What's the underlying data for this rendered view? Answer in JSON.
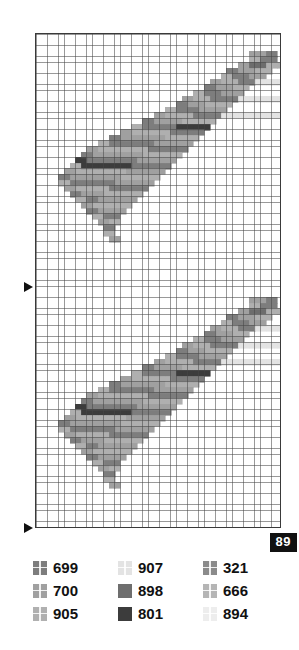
{
  "figure": {
    "page_badge": "89",
    "map": {
      "grid": {
        "cell_px": 5.6,
        "cols": 44,
        "rows": 88,
        "line_color": "#464646",
        "background": "#ffffff",
        "border_color": "#3a3a3a"
      },
      "markers": [
        {
          "name": "tick-arrow-mid",
          "glyph": "right-triangle",
          "y": 287
        },
        {
          "name": "tick-arrow-bottom",
          "glyph": "right-triangle",
          "y": 528
        }
      ]
    },
    "legend": {
      "columns": 3,
      "rows": [
        [
          {
            "code": "699",
            "color": "#7d7d7d",
            "pattern": "cross"
          },
          {
            "code": "907",
            "color": "#e3e3e3",
            "pattern": "cross"
          },
          {
            "code": "321",
            "color": "#8b8b8b",
            "pattern": "cross"
          }
        ],
        [
          {
            "code": "700",
            "color": "#a0a0a0",
            "pattern": "cross"
          },
          {
            "code": "898",
            "color": "#6e6e6e",
            "pattern": "solid"
          },
          {
            "code": "666",
            "color": "#b5b5b5",
            "pattern": "cross"
          }
        ],
        [
          {
            "code": "905",
            "color": "#b0b0b0",
            "pattern": "cross"
          },
          {
            "code": "801",
            "color": "#3c3c3c",
            "pattern": "solid"
          },
          {
            "code": "894",
            "color": "#ededed",
            "pattern": "cross"
          }
        ]
      ]
    },
    "chart_data": {
      "type": "heatmap",
      "title": "",
      "xlabel": "",
      "ylabel": "",
      "grid": true,
      "legend_position": "bottom",
      "categories": [
        "699",
        "700",
        "905",
        "907",
        "898",
        "801",
        "321",
        "666",
        "894"
      ],
      "class_colors": [
        "#7d7d7d",
        "#a0a0a0",
        "#b0b0b0",
        "#e3e3e3",
        "#6e6e6e",
        "#3c3c3c",
        "#8b8b8b",
        "#b5b5b5",
        "#ededed"
      ],
      "description": "Rasterised dendritic/branching soil-or-drainage map on a 44x88 square grid; the same branching motif repeats twice vertically.",
      "cells": {
        "note": "Run-length description per row band of the repeating 44x44 motif: [row, startCol, endCol, classIndex]",
        "runs": [
          [
            3,
            38,
            40,
            1
          ],
          [
            3,
            41,
            42,
            0
          ],
          [
            4,
            38,
            39,
            2
          ],
          [
            4,
            40,
            42,
            0
          ],
          [
            5,
            36,
            37,
            1
          ],
          [
            5,
            38,
            40,
            4
          ],
          [
            5,
            41,
            43,
            2
          ],
          [
            6,
            34,
            35,
            0
          ],
          [
            6,
            36,
            38,
            1
          ],
          [
            6,
            39,
            41,
            2
          ],
          [
            7,
            33,
            34,
            2
          ],
          [
            7,
            35,
            37,
            0
          ],
          [
            7,
            38,
            40,
            1
          ],
          [
            8,
            31,
            32,
            1
          ],
          [
            8,
            33,
            35,
            2
          ],
          [
            8,
            36,
            38,
            0
          ],
          [
            8,
            39,
            43,
            3
          ],
          [
            9,
            30,
            31,
            0
          ],
          [
            9,
            32,
            34,
            1
          ],
          [
            9,
            35,
            37,
            2
          ],
          [
            10,
            28,
            29,
            2
          ],
          [
            10,
            30,
            32,
            0
          ],
          [
            10,
            33,
            36,
            1
          ],
          [
            11,
            26,
            27,
            1
          ],
          [
            11,
            28,
            30,
            2
          ],
          [
            11,
            31,
            35,
            0
          ],
          [
            11,
            36,
            43,
            3
          ],
          [
            12,
            25,
            26,
            0
          ],
          [
            12,
            27,
            29,
            1
          ],
          [
            12,
            30,
            34,
            2
          ],
          [
            13,
            23,
            24,
            2
          ],
          [
            13,
            25,
            28,
            0
          ],
          [
            13,
            29,
            33,
            1
          ],
          [
            14,
            21,
            22,
            1
          ],
          [
            14,
            23,
            27,
            2
          ],
          [
            14,
            28,
            32,
            0
          ],
          [
            14,
            33,
            43,
            3
          ],
          [
            15,
            19,
            20,
            0
          ],
          [
            15,
            21,
            25,
            1
          ],
          [
            15,
            26,
            31,
            2
          ],
          [
            16,
            17,
            18,
            2
          ],
          [
            16,
            19,
            24,
            0
          ],
          [
            16,
            25,
            30,
            5
          ],
          [
            17,
            15,
            16,
            1
          ],
          [
            17,
            17,
            23,
            2
          ],
          [
            17,
            24,
            29,
            0
          ],
          [
            18,
            13,
            14,
            0
          ],
          [
            18,
            15,
            22,
            1
          ],
          [
            18,
            23,
            28,
            2
          ],
          [
            19,
            11,
            12,
            2
          ],
          [
            19,
            13,
            20,
            0
          ],
          [
            19,
            21,
            27,
            1
          ],
          [
            20,
            9,
            10,
            1
          ],
          [
            20,
            11,
            19,
            2
          ],
          [
            20,
            20,
            26,
            0
          ],
          [
            21,
            8,
            9,
            0
          ],
          [
            21,
            10,
            18,
            1
          ],
          [
            21,
            19,
            25,
            2
          ],
          [
            22,
            7,
            8,
            5
          ],
          [
            22,
            9,
            17,
            0
          ],
          [
            22,
            18,
            24,
            1
          ],
          [
            23,
            6,
            7,
            2
          ],
          [
            23,
            8,
            16,
            5
          ],
          [
            23,
            17,
            23,
            0
          ],
          [
            24,
            5,
            6,
            1
          ],
          [
            24,
            7,
            15,
            2
          ],
          [
            24,
            16,
            22,
            1
          ],
          [
            25,
            4,
            5,
            0
          ],
          [
            25,
            6,
            14,
            1
          ],
          [
            25,
            15,
            21,
            2
          ],
          [
            26,
            4,
            5,
            2
          ],
          [
            26,
            6,
            13,
            0
          ],
          [
            26,
            14,
            20,
            1
          ],
          [
            27,
            5,
            6,
            1
          ],
          [
            27,
            7,
            12,
            2
          ],
          [
            27,
            13,
            19,
            0
          ],
          [
            28,
            6,
            7,
            0
          ],
          [
            28,
            8,
            11,
            1
          ],
          [
            28,
            12,
            18,
            2
          ],
          [
            29,
            7,
            8,
            2
          ],
          [
            29,
            9,
            10,
            0
          ],
          [
            29,
            11,
            17,
            1
          ],
          [
            30,
            8,
            9,
            1
          ],
          [
            30,
            10,
            16,
            2
          ],
          [
            31,
            9,
            10,
            0
          ],
          [
            31,
            11,
            15,
            1
          ],
          [
            32,
            10,
            11,
            2
          ],
          [
            32,
            12,
            14,
            0
          ],
          [
            33,
            11,
            12,
            1
          ],
          [
            33,
            13,
            14,
            2
          ],
          [
            34,
            12,
            13,
            0
          ],
          [
            35,
            12,
            13,
            2
          ],
          [
            36,
            13,
            14,
            1
          ]
        ]
      }
    }
  }
}
